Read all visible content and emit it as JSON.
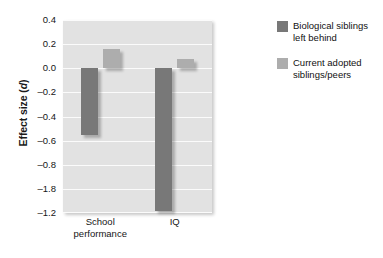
{
  "chart_data": {
    "type": "bar",
    "title": "",
    "xlabel": "",
    "ylabel": "Effect size (d)",
    "ylabel_plain": "Effect size",
    "ylabel_italic_part": "d",
    "categories": [
      "School performance",
      "IQ"
    ],
    "category_lines": [
      [
        "School",
        "performance"
      ],
      [
        "IQ"
      ]
    ],
    "series": [
      {
        "name": "Biological siblings left behind",
        "name_lines": [
          "Biological siblings",
          "left behind"
        ],
        "color": "#787878",
        "values": [
          -0.55,
          -1.18
        ]
      },
      {
        "name": "Current adopted siblings/peers",
        "name_lines": [
          "Current adopted",
          "siblings/peers"
        ],
        "color": "#adadad",
        "values": [
          0.16,
          0.08
        ]
      }
    ],
    "ylim": [
      -1.2,
      0.4
    ],
    "ytick_labels": [
      "0.4",
      "0.2",
      "0.0",
      "-0.2",
      "-0.4",
      "-0.6",
      "-0.8",
      "-1.8",
      "-1.2"
    ],
    "ytick_values": [
      0.4,
      0.2,
      0.0,
      -0.2,
      -0.4,
      -0.6,
      -0.8,
      -1.0,
      -1.2
    ],
    "grid": true,
    "grid_color": "#fbfbfb",
    "plot_background": "#e2e2e2",
    "legend_position": "right",
    "zero_line_value": 0.0
  }
}
